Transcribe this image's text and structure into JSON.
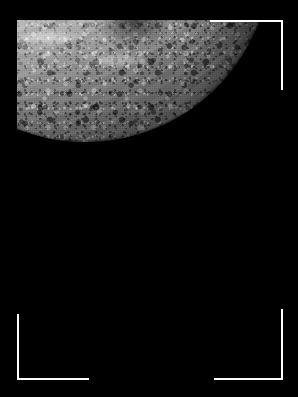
{
  "viewer": {
    "background_color": "#000000",
    "width": 298,
    "height": 397
  },
  "photo": {
    "subject": "cratered icy moon limb",
    "description": "Grayscale spacecraft photograph of a heavily cratered icy moon, lit from the upper left, with the terminator shading the lower right into darkness",
    "palette": {
      "space": "#000000",
      "highlight": "#f2f2f2",
      "midtone": "#8a8a8a",
      "shadow": "#1a1a1a",
      "bracket": "#ffffff"
    },
    "lighting": {
      "sun_direction": "upper-left",
      "terminator": "lower-right"
    },
    "bounds": {
      "left": 17,
      "top": 20,
      "width": 244,
      "height": 348
    }
  },
  "framing": {
    "brackets": [
      {
        "name": "top-right",
        "corner": "top-right",
        "color": "#ffffff",
        "thickness": 2,
        "arm_length": 72
      },
      {
        "name": "bottom-left",
        "corner": "bottom-left",
        "color": "#ffffff",
        "thickness": 2,
        "arm_length": 70
      },
      {
        "name": "bottom-right",
        "corner": "bottom-right",
        "color": "#ffffff",
        "thickness": 2,
        "arm_length": 70
      }
    ],
    "missing_corner": "top-left"
  },
  "caption": {
    "alt_text": "Cratered moon surface photographed against black space, framed by white corner brackets"
  }
}
